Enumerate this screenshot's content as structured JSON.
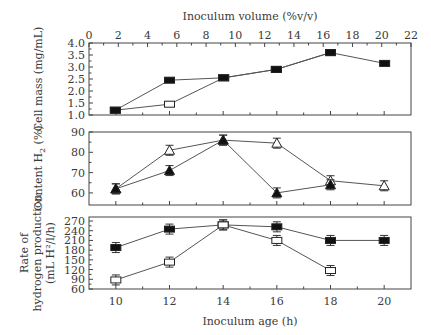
{
  "chart_data": [
    {
      "type": "line",
      "panel": "top",
      "title": "",
      "xlabel": "Inoculum volume (%v/v)",
      "ylabel": "Cell mass (mg/mL)",
      "xlim": [
        0,
        22
      ],
      "ylim": [
        1.0,
        4.0
      ],
      "x_ticks": [
        0,
        2,
        4,
        6,
        8,
        10,
        12,
        14,
        16,
        18,
        20,
        22
      ],
      "y_ticks": [
        1.0,
        1.5,
        2.0,
        2.5,
        3.0,
        3.5,
        4.0
      ],
      "grid": false,
      "series": [
        {
          "name": "Inoculum volume (open squares)",
          "marker": "open-square",
          "x": [
            1.8,
            5.5,
            9.2,
            12.8,
            16.5
          ],
          "values": [
            1.2,
            1.45,
            2.55,
            2.9,
            3.6
          ]
        },
        {
          "name": "Inoculum age (filled squares)",
          "marker": "filled-square",
          "x": [
            1.8,
            5.5,
            9.2,
            12.8,
            16.5,
            20.2
          ],
          "values": [
            1.2,
            2.45,
            2.55,
            2.9,
            3.6,
            3.15
          ]
        }
      ]
    },
    {
      "type": "line",
      "panel": "middle",
      "xlabel": "Inoculum age (h)",
      "ylabel": "Content H2 (%)",
      "xlim": [
        9,
        21
      ],
      "ylim": [
        55,
        90
      ],
      "y_ticks": [
        60,
        70,
        80,
        90
      ],
      "grid": false,
      "series": [
        {
          "name": "Open triangles",
          "marker": "open-triangle",
          "x": [
            10,
            12,
            14,
            16,
            18,
            20
          ],
          "values": [
            62,
            81,
            86,
            84.5,
            66,
            63.5
          ]
        },
        {
          "name": "Filled triangles",
          "marker": "filled-triangle",
          "x": [
            10,
            12,
            14,
            16,
            18
          ],
          "values": [
            62,
            71,
            86,
            60,
            64
          ]
        }
      ]
    },
    {
      "type": "line",
      "panel": "bottom",
      "xlabel": "Inoculum age (h)",
      "ylabel": "Rate of hydrogen production (mL H2/l/h)",
      "xlim": [
        9,
        21
      ],
      "ylim": [
        60,
        280
      ],
      "x_ticks": [
        10,
        12,
        14,
        16,
        18,
        20
      ],
      "y_ticks": [
        60,
        90,
        120,
        150,
        180,
        210,
        240,
        270
      ],
      "grid": false,
      "series": [
        {
          "name": "Filled squares",
          "marker": "filled-square",
          "x": [
            10,
            12,
            14,
            16,
            18,
            20
          ],
          "values": [
            188,
            245,
            258,
            252,
            210,
            210
          ]
        },
        {
          "name": "Open squares",
          "marker": "open-square",
          "x": [
            10,
            12,
            14,
            16,
            18
          ],
          "values": [
            88,
            143,
            258,
            210,
            117
          ]
        }
      ]
    }
  ],
  "labels": {
    "top_xlabel": "Inoculum volume (%v/v)",
    "bottom_xlabel": "Inoculum age (h)",
    "ylabel_top": "Cell mass (mg/mL)",
    "ylabel_mid_prefix": "Content H",
    "ylabel_mid_sub": "2",
    "ylabel_mid_suffix": " (%)",
    "ylabel_bot_line1": "Rate of",
    "ylabel_bot_line2": "hydrogen production",
    "ylabel_bot_line3": "(mL H²/l/h)"
  }
}
